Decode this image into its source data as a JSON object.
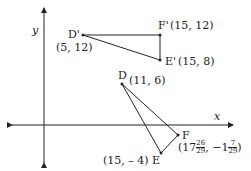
{
  "axes": {
    "x_label": "x",
    "y_label": "y"
  },
  "image_triangle": {
    "D_prime": {
      "name": "D'",
      "coord": "(5, 12)"
    },
    "E_prime": {
      "name": "E'",
      "coord": "(15, 8)"
    },
    "F_prime": {
      "name": "F'",
      "coord": "(15, 12)"
    }
  },
  "original_triangle": {
    "D": {
      "name": "D",
      "coord": "(11, 6)"
    },
    "E": {
      "name": "E",
      "coord": "(15, – 4)"
    },
    "F": {
      "name": "F",
      "coord_whole_x": "(17",
      "coord_frac_x_num": "26",
      "coord_frac_x_den": "29",
      "coord_sep": ", −1",
      "coord_frac_y_num": "7",
      "coord_frac_y_den": "29",
      "coord_close": ")"
    }
  },
  "colors": {
    "line": "#222222",
    "background": "#ffffff"
  }
}
